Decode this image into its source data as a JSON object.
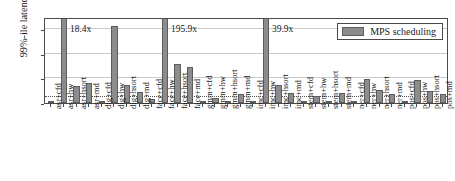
{
  "chart_data": {
    "type": "bar",
    "title": "",
    "xlabel": "",
    "ylabel": "99%-ile latency",
    "ylim": [
      0,
      14
    ],
    "yticks": [
      0,
      4,
      8,
      12
    ],
    "ytick_labels": [
      "0",
      "4x",
      "8x",
      "12x"
    ],
    "grid": true,
    "reference_line": {
      "value": 1,
      "style": "dotted"
    },
    "legend": {
      "position": "top-right",
      "entries": [
        "MPS scheduling"
      ]
    },
    "categories": [
      "asr+cfd",
      "asr+hw",
      "asr+hsort",
      "asr+md",
      "dig+cfd",
      "dig+hw",
      "dig+hsort",
      "dig+md",
      "face+cfd",
      "face+hw",
      "face+hsort",
      "face+md",
      "gmm+cfd",
      "gmm+hw",
      "gmm+hsort",
      "gmm+md",
      "imc+cfd",
      "imc+hw",
      "imc+hsort",
      "imc+md",
      "stem+cfd",
      "stem+hw",
      "stem+hsort",
      "stem+md",
      "ner+cfd",
      "ner+hw",
      "ner+hsort",
      "ner+md",
      "pos+cfd",
      "pos+hw",
      "pos+hsort",
      "pos+md"
    ],
    "series": [
      {
        "name": "MPS scheduling",
        "values": [
          0.2,
          18.4,
          2.85,
          3.2,
          0.15,
          12.6,
          2.95,
          1.75,
          0.6,
          195.9,
          6.4,
          5.9,
          0.1,
          0.85,
          0.2,
          1.5,
          0.12,
          39.9,
          3.0,
          1.7,
          0.2,
          1.2,
          0.3,
          1.65,
          0.05,
          3.85,
          2.1,
          1.45,
          0.05,
          3.8,
          1.9,
          1.4
        ]
      }
    ],
    "clipped_bars": [
      {
        "category": "asr+hw",
        "label": "18.4x"
      },
      {
        "category": "face+hw",
        "label": "195.9x"
      },
      {
        "category": "imc+hw",
        "label": "39.9x"
      }
    ],
    "annotations": [
      "18.4x",
      "195.9x",
      "39.9x"
    ]
  }
}
